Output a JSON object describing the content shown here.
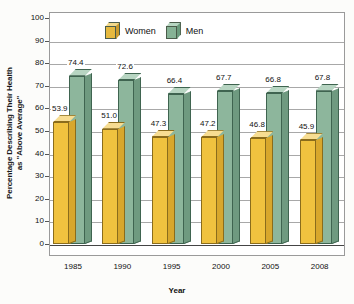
{
  "chart_data": {
    "type": "bar",
    "title": "",
    "xlabel": "Year",
    "ylabel_line1": "Percentage Describing Their Health",
    "ylabel_line2": "as \"Above Average\"",
    "categories": [
      "1985",
      "1990",
      "1995",
      "2000",
      "2005",
      "2008"
    ],
    "series": [
      {
        "name": "Women",
        "color": "#f0c23f",
        "values": [
          53.9,
          51.0,
          47.3,
          47.2,
          46.8,
          45.9
        ],
        "labels": [
          "53.9",
          "51.0",
          "47.3",
          "47.2",
          "46.8",
          "45.9"
        ]
      },
      {
        "name": "Men",
        "color": "#8db69c",
        "values": [
          74.4,
          72.6,
          66.4,
          67.7,
          66.8,
          67.8
        ],
        "labels": [
          "74.4",
          "72.6",
          "66.4",
          "67.7",
          "66.8",
          "67.8"
        ]
      }
    ],
    "ylim": [
      0,
      100
    ],
    "ytick_step": 10,
    "yticks": [
      "100",
      "90",
      "80",
      "70",
      "60",
      "50",
      "40",
      "30",
      "20",
      "10",
      "0"
    ],
    "grid": true,
    "legend_position": "top-center",
    "style": "3d-columns"
  },
  "legend": {
    "items": [
      {
        "label": "Women",
        "icon": "cube-icon-women"
      },
      {
        "label": "Men",
        "icon": "cube-icon-men"
      }
    ]
  },
  "axes": {
    "y_title_line1": "Percentage Describing Their Health",
    "y_title_line2": "as \"Above Average\"",
    "x_title": "Year"
  }
}
